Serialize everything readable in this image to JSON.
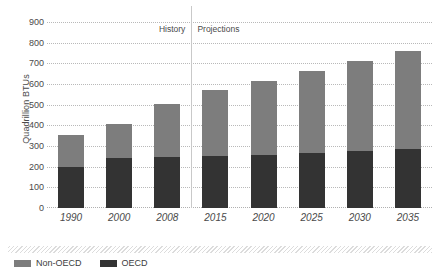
{
  "chart_data": {
    "type": "bar",
    "stacked": true,
    "title": "",
    "xlabel": "",
    "ylabel": "Quadrillion BTUs",
    "categories": [
      "1990",
      "2000",
      "2008",
      "2015",
      "2020",
      "2025",
      "2030",
      "2035"
    ],
    "series": [
      {
        "name": "OECD",
        "color": "#333333",
        "values": [
          200,
          240,
          245,
          250,
          255,
          265,
          275,
          285
        ]
      },
      {
        "name": "Non-OECD",
        "color": "#7d7d7d",
        "values": [
          155,
          165,
          260,
          320,
          360,
          400,
          435,
          475
        ]
      }
    ],
    "totals": [
      355,
      405,
      505,
      570,
      615,
      665,
      710,
      760
    ],
    "ylim": [
      0,
      900
    ],
    "ytick_step": 100,
    "yticks": [
      "900",
      "800",
      "700",
      "600",
      "500",
      "400",
      "300",
      "200",
      "100",
      "0"
    ],
    "grid": true,
    "legend_position": "bottom-left",
    "legend_order": [
      "Non-OECD",
      "OECD"
    ],
    "annotations": [
      {
        "name": "history-label",
        "text": "History"
      },
      {
        "name": "projections-label",
        "text": "Projections"
      }
    ],
    "divider_between": [
      "2008",
      "2015"
    ]
  },
  "colors": {
    "oecd": "#333333",
    "non_oecd": "#7d7d7d",
    "grid": "#b9b9b9",
    "divider": "#c9c9c9",
    "text": "#4a4a4a",
    "background": "#ffffff"
  }
}
